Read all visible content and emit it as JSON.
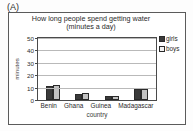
{
  "panel": {
    "label": "(A)"
  },
  "axis": {
    "y_title": "minutes",
    "x_title": "country",
    "y_ticks": [
      "0",
      "10",
      "20",
      "30",
      "40",
      "50"
    ]
  },
  "legend": {
    "items": [
      {
        "label": "girls",
        "color": "#3a3a3a",
        "icon": "legend-swatch-filled"
      },
      {
        "label": "boys",
        "color": "#f2f2f2",
        "icon": "legend-swatch-outline"
      }
    ]
  },
  "chart_data": {
    "type": "bar",
    "title": "How long people spend getting water (minutes a day)",
    "title_line1": "How long people spend getting water",
    "title_line2": "(minutes a day)",
    "xlabel": "country",
    "ylabel": "minutes",
    "ylim": [
      0,
      50
    ],
    "ytick_step": 10,
    "grid": true,
    "legend_position": "right",
    "categories": [
      "Benin",
      "Ghana",
      "Guinea",
      "Madagascar"
    ],
    "series": [
      {
        "name": "girls",
        "color": "#3a3a3a",
        "values": [
          11,
          5,
          3,
          9
        ]
      },
      {
        "name": "boys",
        "color": "#c2c2c2",
        "values": [
          12,
          6,
          3,
          9
        ]
      }
    ]
  }
}
